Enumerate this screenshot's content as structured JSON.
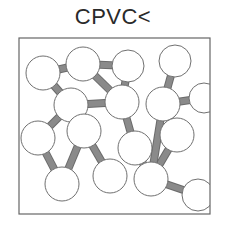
{
  "title": "CPVC<",
  "diagram": {
    "frame": {
      "x": 19,
      "y": 38,
      "w": 191,
      "h": 176,
      "stroke": "#666666"
    },
    "atom_fill": "#ffffff",
    "atom_stroke": "#707070",
    "bond_fill": "#8a8a8a",
    "atoms": [
      {
        "x": 43,
        "y": 73,
        "r": 17
      },
      {
        "x": 83,
        "y": 64,
        "r": 17
      },
      {
        "x": 128,
        "y": 66,
        "r": 16
      },
      {
        "x": 175,
        "y": 61,
        "r": 16
      },
      {
        "x": 71,
        "y": 105,
        "r": 17
      },
      {
        "x": 122,
        "y": 102,
        "r": 17
      },
      {
        "x": 163,
        "y": 104,
        "r": 17
      },
      {
        "x": 204,
        "y": 98,
        "r": 15
      },
      {
        "x": 38,
        "y": 138,
        "r": 17
      },
      {
        "x": 84,
        "y": 131,
        "r": 17
      },
      {
        "x": 135,
        "y": 148,
        "r": 17
      },
      {
        "x": 177,
        "y": 135,
        "r": 17
      },
      {
        "x": 62,
        "y": 184,
        "r": 17
      },
      {
        "x": 110,
        "y": 176,
        "r": 17
      },
      {
        "x": 151,
        "y": 179,
        "r": 17
      },
      {
        "x": 198,
        "y": 195,
        "r": 16
      }
    ],
    "bonds": [
      [
        0,
        1
      ],
      [
        1,
        2
      ],
      [
        1,
        5
      ],
      [
        0,
        4
      ],
      [
        4,
        5
      ],
      [
        2,
        5
      ],
      [
        3,
        6
      ],
      [
        6,
        7
      ],
      [
        6,
        11
      ],
      [
        5,
        10
      ],
      [
        4,
        9
      ],
      [
        4,
        8
      ],
      [
        8,
        12
      ],
      [
        9,
        12
      ],
      [
        9,
        13
      ],
      [
        10,
        14
      ],
      [
        11,
        14
      ],
      [
        14,
        15
      ],
      [
        6,
        14
      ]
    ]
  }
}
